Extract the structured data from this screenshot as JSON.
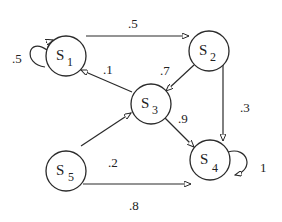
{
  "diagram": {
    "type": "markov-chain-state-diagram",
    "nodes": [
      {
        "id": "S1",
        "base": "S",
        "sub": "1",
        "x": 66,
        "y": 56
      },
      {
        "id": "S2",
        "base": "S",
        "sub": "2",
        "x": 209,
        "y": 51
      },
      {
        "id": "S3",
        "base": "S",
        "sub": "3",
        "x": 151,
        "y": 104
      },
      {
        "id": "S4",
        "base": "S",
        "sub": "4",
        "x": 210,
        "y": 160
      },
      {
        "id": "S5",
        "base": "S",
        "sub": "5",
        "x": 66,
        "y": 160
      }
    ],
    "edges": [
      {
        "from": "S1",
        "to": "S1",
        "label": ".5"
      },
      {
        "from": "S1",
        "to": "S2",
        "label": ".5"
      },
      {
        "from": "S2",
        "to": "S3",
        "label": ".7"
      },
      {
        "from": "S2",
        "to": "S4",
        "label": ".3"
      },
      {
        "from": "S3",
        "to": "S1",
        "label": ".1"
      },
      {
        "from": "S3",
        "to": "S4",
        "label": ".9"
      },
      {
        "from": "S5",
        "to": "S3",
        "label": ".2"
      },
      {
        "from": "S5",
        "to": "S4",
        "label": ".8"
      },
      {
        "from": "S4",
        "to": "S4",
        "label": "1"
      }
    ]
  }
}
